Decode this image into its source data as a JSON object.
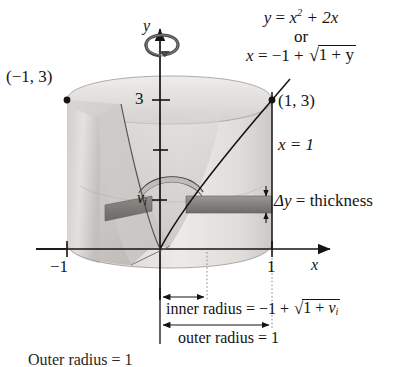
{
  "figure": {
    "type": "solid-of-revolution-washer-method",
    "title_hidden": "Washer method diagram",
    "axes": {
      "x_label": "x",
      "y_label": "y",
      "x_ticks": [
        {
          "value": "-1",
          "display": "−1"
        },
        {
          "value": "1",
          "display": "1"
        }
      ],
      "y_ticks": [
        {
          "value": "3",
          "display": "3"
        },
        {
          "value": "v_i",
          "display": "v",
          "sub": "i"
        }
      ]
    },
    "curve_label": {
      "line1_lhs": "y",
      "line1_eq": "=",
      "line1_rhs_base": "x",
      "line1_rhs_exp": "2",
      "line1_rhs_tail": "+ 2x",
      "connector": "or",
      "line3_lhs": "x",
      "line3_eq": "=",
      "line3_neg": "−1 +",
      "line3_radical": "√",
      "line3_radicand": "1 + y"
    },
    "points": [
      {
        "name": "left-top-point",
        "label": "(−1, 3)"
      },
      {
        "name": "right-top-point",
        "label": "(1, 3)"
      }
    ],
    "line_label": "x = 1",
    "thickness_label": {
      "symbol": "Δy",
      "eq": "=",
      "text": "thickness"
    },
    "inner_radius": {
      "text": "inner radius",
      "eq": "=",
      "value_prefix": "−1 +",
      "radical": "√",
      "radicand_a": "1 + ",
      "radicand_var": "v",
      "radicand_sub": "i"
    },
    "outer_radius": {
      "text": "outer radius",
      "eq": "=",
      "value": "1"
    },
    "footer_cut": {
      "text": "Outer radius = 1"
    },
    "colors": {
      "ink": "#141414",
      "solid_light": "#e4e2e0",
      "solid_mid": "#c9c6c3",
      "solid_dark": "#a7a3a0",
      "slab": "#8a8784",
      "background": "#ffffff"
    }
  }
}
